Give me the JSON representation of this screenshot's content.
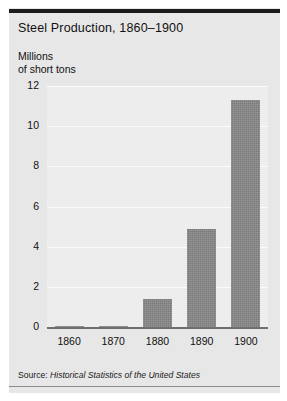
{
  "figure": {
    "title": "Steel Production, 1860–1900",
    "y_axis_title_line1": "Millions",
    "y_axis_title_line2": "of short tons",
    "source_label": "Source:",
    "source_title": "Historical Statistics of the United States",
    "colors": {
      "card_background": "#e7e7e7",
      "plot_background": "#ededed",
      "bar_fill": "#7b7b7b",
      "gridline": "#fbfbfb",
      "axis_line": "#6f6f6f",
      "top_rule": "#1b1b1b",
      "bottom_rule": "#8d8d8d",
      "text": "#111111"
    }
  },
  "chart_data": {
    "type": "bar",
    "title": "Steel Production, 1860–1900",
    "xlabel": "",
    "ylabel": "Millions of short tons",
    "categories": [
      "1860",
      "1870",
      "1880",
      "1890",
      "1900"
    ],
    "values": [
      0.01,
      0.07,
      1.4,
      4.9,
      11.3
    ],
    "ylim": [
      0,
      12
    ],
    "yticks": [
      0,
      2,
      4,
      6,
      8,
      10,
      12
    ],
    "ytick_labels": [
      "0",
      "2",
      "4",
      "6",
      "8",
      "10",
      "12"
    ],
    "xtick_labels": [
      "1860",
      "1870",
      "1880",
      "1890",
      "1900"
    ],
    "grid": true,
    "grid_axis": "y",
    "legend": false,
    "series": [
      {
        "name": "Steel production",
        "values": [
          0.01,
          0.07,
          1.4,
          4.9,
          11.3
        ]
      }
    ],
    "annotations": [
      "Source: Historical Statistics of the United States"
    ]
  }
}
